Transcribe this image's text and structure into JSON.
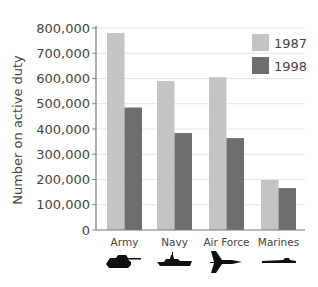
{
  "chart_data": {
    "type": "bar",
    "title": "",
    "xlabel": "",
    "ylabel": "Number on active duty",
    "ylim": [
      0,
      800000
    ],
    "yticks": [
      0,
      100000,
      200000,
      300000,
      400000,
      500000,
      600000,
      700000,
      800000
    ],
    "ytick_labels": [
      "0",
      "100,000",
      "200,000",
      "300,000",
      "400,000",
      "500,000",
      "600,000",
      "700,000",
      "800,000"
    ],
    "grid": true,
    "legend_position": "upper right",
    "categories": [
      "Army",
      "Navy",
      "Air Force",
      "Marines"
    ],
    "category_icons": [
      "tank-icon",
      "ship-icon",
      "fighter-jet-icon",
      "submarine-icon"
    ],
    "series": [
      {
        "name": "1987",
        "color": "#c4c4c4",
        "values": [
          780000,
          590000,
          605000,
          198000
        ]
      },
      {
        "name": "1998",
        "color": "#6e6e6e",
        "values": [
          485000,
          384000,
          364000,
          166000
        ]
      }
    ]
  }
}
